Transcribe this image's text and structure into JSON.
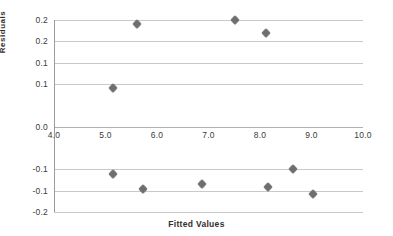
{
  "chart_data": {
    "type": "scatter",
    "title": "",
    "xlabel": "Fitted Values",
    "ylabel": "Residuals",
    "xlim": [
      4.0,
      10.0
    ],
    "ylim": [
      -0.2,
      0.25
    ],
    "grid": true,
    "legend": "none",
    "marker_color": "#7a7a7a",
    "gridline_color": "#c9c9c9",
    "axis_color": "#9b9b9b",
    "x_ticks": [
      "4.0",
      "5.0",
      "6.0",
      "7.0",
      "8.0",
      "9.0",
      "10.0"
    ],
    "x_tick_values": [
      4.0,
      5.0,
      6.0,
      7.0,
      8.0,
      9.0,
      10.0
    ],
    "y_ticks": [
      "0.2",
      "0.2",
      "0.1",
      "0.1",
      "0.0",
      "-0.1",
      "-0.1",
      "-0.2"
    ],
    "y_tick_values": [
      0.25,
      0.2,
      0.15,
      0.1,
      0.0,
      -0.1,
      -0.15,
      -0.2
    ],
    "series": [
      {
        "name": "Residuals",
        "points": [
          {
            "x": 5.15,
            "y": 0.09
          },
          {
            "x": 5.62,
            "y": 0.24
          },
          {
            "x": 7.52,
            "y": 0.25
          },
          {
            "x": 8.12,
            "y": 0.22
          },
          {
            "x": 5.15,
            "y": -0.112
          },
          {
            "x": 5.72,
            "y": -0.146
          },
          {
            "x": 6.88,
            "y": -0.135
          },
          {
            "x": 8.15,
            "y": -0.142
          },
          {
            "x": 8.65,
            "y": -0.1
          },
          {
            "x": 9.02,
            "y": -0.158
          }
        ]
      }
    ]
  }
}
